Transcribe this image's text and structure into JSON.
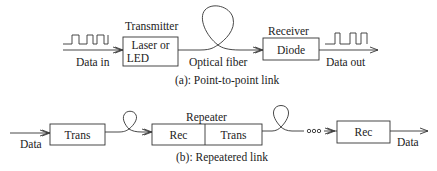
{
  "diagram": {
    "part_a": {
      "caption": "(a): Point-to-point link",
      "input_label": "Data in",
      "transmitter": {
        "title": "Transmitter",
        "line1": "Laser or",
        "line2": "LED"
      },
      "fiber_label": "Optical fiber",
      "receiver": {
        "title": "Receiver",
        "body": "Diode"
      },
      "output_label": "Data out"
    },
    "part_b": {
      "caption": "(b): Repeatered link",
      "input_label": "Data",
      "trans_box": "Trans",
      "repeater": {
        "title": "Repeater",
        "left": "Rec",
        "right": "Trans"
      },
      "ellipsis": "ooo",
      "final_rec": "Rec",
      "output_label": "Data"
    }
  }
}
